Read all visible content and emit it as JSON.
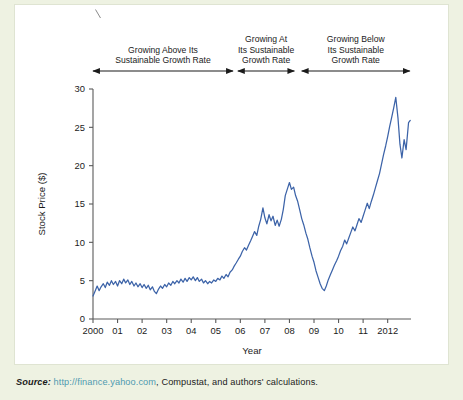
{
  "figure": {
    "bands": [
      {
        "id": "band-above",
        "lines": [
          "Growing Above Its",
          "Sustainable Growth Rate"
        ],
        "x_start_year": 2000.0,
        "x_end_year": 2005.7
      },
      {
        "id": "band-at",
        "lines": [
          "Growing At",
          "Its Sustainable",
          "Growth Rate"
        ],
        "x_start_year": 2005.9,
        "x_end_year": 2008.2
      },
      {
        "id": "band-below",
        "lines": [
          "Growing Below",
          "Its Sustainable",
          "Growth Rate"
        ],
        "x_start_year": 2008.5,
        "x_end_year": 2012.9
      }
    ],
    "source": {
      "prefix": "Source:",
      "url": "http://finance.yahoo.com",
      "rest": ", Compustat, and authors' calculations."
    },
    "colors": {
      "series_line": "#3c63a8",
      "page_background": "#eef2e2",
      "panel_background": "#ffffff",
      "panel_border": "#dfe4d2",
      "axis": "#5a5a5a",
      "text": "#1b1b1b",
      "url": "#4e9ab0"
    }
  },
  "chart_data": {
    "type": "line",
    "title": "",
    "xlabel": "Year",
    "ylabel": "Stock Price ($)",
    "xlim": [
      2000,
      2012.95
    ],
    "ylim": [
      0,
      30
    ],
    "yticks": [
      0,
      5,
      10,
      15,
      20,
      25,
      30
    ],
    "ytick_labels": [
      "0",
      "5",
      "10",
      "15",
      "20",
      "25",
      "30"
    ],
    "xticks": [
      2000,
      2001,
      2002,
      2003,
      2004,
      2005,
      2006,
      2007,
      2008,
      2009,
      2010,
      2011,
      2012
    ],
    "xtick_labels": [
      "2000",
      "01",
      "02",
      "03",
      "04",
      "05",
      "06",
      "07",
      "08",
      "09",
      "10",
      "11",
      "2012"
    ],
    "grid": false,
    "legend": "none",
    "series": [
      {
        "name": "Stock Price",
        "color": "#3c63a8",
        "x": [
          2000.0,
          2000.08,
          2000.17,
          2000.25,
          2000.33,
          2000.42,
          2000.5,
          2000.58,
          2000.67,
          2000.75,
          2000.83,
          2000.92,
          2001.0,
          2001.08,
          2001.17,
          2001.25,
          2001.33,
          2001.42,
          2001.5,
          2001.58,
          2001.67,
          2001.75,
          2001.83,
          2001.92,
          2002.0,
          2002.08,
          2002.17,
          2002.25,
          2002.33,
          2002.42,
          2002.5,
          2002.58,
          2002.67,
          2002.75,
          2002.83,
          2002.92,
          2003.0,
          2003.08,
          2003.17,
          2003.25,
          2003.33,
          2003.42,
          2003.5,
          2003.58,
          2003.67,
          2003.75,
          2003.83,
          2003.92,
          2004.0,
          2004.08,
          2004.17,
          2004.25,
          2004.33,
          2004.42,
          2004.5,
          2004.58,
          2004.67,
          2004.75,
          2004.83,
          2004.92,
          2005.0,
          2005.08,
          2005.17,
          2005.25,
          2005.33,
          2005.42,
          2005.5,
          2005.58,
          2005.67,
          2005.75,
          2005.83,
          2005.92,
          2006.0,
          2006.08,
          2006.17,
          2006.25,
          2006.33,
          2006.42,
          2006.5,
          2006.58,
          2006.67,
          2006.75,
          2006.83,
          2006.92,
          2007.0,
          2007.08,
          2007.17,
          2007.25,
          2007.33,
          2007.42,
          2007.5,
          2007.58,
          2007.67,
          2007.75,
          2007.83,
          2007.92,
          2008.0,
          2008.08,
          2008.17,
          2008.25,
          2008.33,
          2008.42,
          2008.5,
          2008.58,
          2008.67,
          2008.75,
          2008.83,
          2008.92,
          2009.0,
          2009.08,
          2009.17,
          2009.25,
          2009.33,
          2009.42,
          2009.5,
          2009.58,
          2009.67,
          2009.75,
          2009.83,
          2009.92,
          2010.0,
          2010.08,
          2010.17,
          2010.25,
          2010.33,
          2010.42,
          2010.5,
          2010.58,
          2010.67,
          2010.75,
          2010.83,
          2010.92,
          2011.0,
          2011.08,
          2011.17,
          2011.25,
          2011.33,
          2011.42,
          2011.5,
          2011.58,
          2011.67,
          2011.75,
          2011.83,
          2011.92,
          2012.0,
          2012.08,
          2012.17,
          2012.25,
          2012.33,
          2012.42,
          2012.5,
          2012.58,
          2012.67,
          2012.75,
          2012.85,
          2012.92
        ],
        "y": [
          3.0,
          3.6,
          4.3,
          3.7,
          4.2,
          4.6,
          4.1,
          4.8,
          4.4,
          5.0,
          4.5,
          4.9,
          4.3,
          5.0,
          4.6,
          5.2,
          4.7,
          5.1,
          4.5,
          4.9,
          4.3,
          4.7,
          4.2,
          4.6,
          4.1,
          4.5,
          4.0,
          4.4,
          3.8,
          4.2,
          3.6,
          3.3,
          3.9,
          4.3,
          4.0,
          4.5,
          4.2,
          4.7,
          4.4,
          4.9,
          4.6,
          5.0,
          4.7,
          5.2,
          4.8,
          5.3,
          4.9,
          5.4,
          5.1,
          5.5,
          5.0,
          5.4,
          4.9,
          5.2,
          4.7,
          5.0,
          4.6,
          4.9,
          4.7,
          5.1,
          4.9,
          5.3,
          5.1,
          5.6,
          5.3,
          5.8,
          5.5,
          6.1,
          6.4,
          6.9,
          7.3,
          7.8,
          8.2,
          8.8,
          9.3,
          9.0,
          9.6,
          10.2,
          10.8,
          11.4,
          10.9,
          12.1,
          13.0,
          14.5,
          13.2,
          12.4,
          13.6,
          12.8,
          13.4,
          12.2,
          12.9,
          12.1,
          13.0,
          14.3,
          16.1,
          17.0,
          17.8,
          16.9,
          17.2,
          16.1,
          15.4,
          14.2,
          13.1,
          12.3,
          11.2,
          10.4,
          9.3,
          8.2,
          7.4,
          6.3,
          5.4,
          4.6,
          4.0,
          3.7,
          4.3,
          5.1,
          5.8,
          6.4,
          7.0,
          7.6,
          8.2,
          8.9,
          9.5,
          10.3,
          9.8,
          10.6,
          11.3,
          12.0,
          11.5,
          12.3,
          13.1,
          12.6,
          13.4,
          14.2,
          15.1,
          14.4,
          15.3,
          16.2,
          17.1,
          18.0,
          19.0,
          20.2,
          21.4,
          22.6,
          23.8,
          25.1,
          26.4,
          27.6,
          28.9,
          26.2,
          22.8,
          21.0,
          23.4,
          22.1,
          25.6,
          25.9
        ]
      }
    ]
  }
}
